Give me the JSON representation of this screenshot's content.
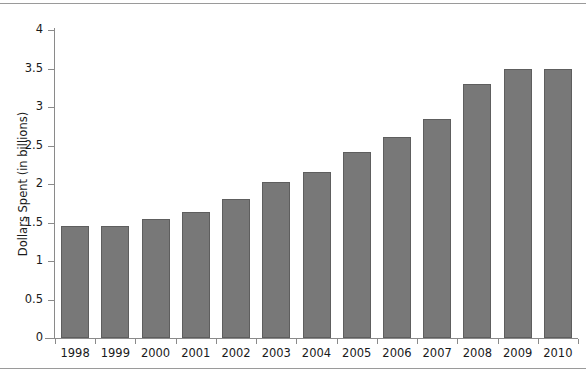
{
  "chart_data": {
    "type": "bar",
    "title": "",
    "xlabel": "",
    "ylabel": "Dollars Spent (in billions)",
    "categories": [
      "1998",
      "1999",
      "2000",
      "2001",
      "2002",
      "2003",
      "2004",
      "2005",
      "2006",
      "2007",
      "2008",
      "2009",
      "2010"
    ],
    "values": [
      1.45,
      1.45,
      1.55,
      1.63,
      1.81,
      2.03,
      2.16,
      2.42,
      2.61,
      2.85,
      3.3,
      3.5,
      3.5
    ],
    "ylim": [
      0,
      4
    ],
    "yticks": [
      0,
      0.5,
      1,
      1.5,
      2,
      2.5,
      3,
      3.5,
      4
    ],
    "ytick_labels": [
      "0",
      "0.5",
      "1",
      "1.5",
      "2",
      "2.5",
      "3",
      "3.5",
      "4"
    ],
    "grid": false,
    "legend": "none",
    "bar_color": "#787878",
    "bar_edge_color": "#5e5e5e",
    "axis_color": "#8a8a8a",
    "text_color": "#1a1a1a"
  }
}
